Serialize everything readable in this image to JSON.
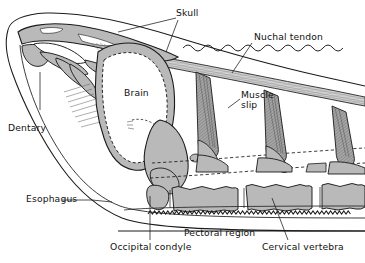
{
  "figure": {
    "kind": "anatomical-cutaway-diagram",
    "background_color": "#ffffff",
    "bone_fill_color": "#b9b9b9",
    "outline_color": "#1a1a1a",
    "tendon_fill_color": "#cfcfcf",
    "brain_fill_color": "#ffffff"
  },
  "labels": {
    "skull": "Skull",
    "nuchal_tendon": "Nuchal tendon",
    "brain": "Brain",
    "muscle_slip": "Muscle\nslip",
    "muscle_slip_line1": "Muscle",
    "muscle_slip_line2": "slip",
    "dentary": "Dentary",
    "esophagus": "Esophagus",
    "occipital_condyle": "Occipital condyle",
    "pectoral_region": "Pectoral region",
    "cervical_vertebra": "Cervical vertebra"
  },
  "structures": [
    {
      "name": "skull",
      "type": "bone",
      "fill": "#b9b9b9"
    },
    {
      "name": "brain",
      "type": "cavity",
      "fill": "#ffffff",
      "outline": "dashed"
    },
    {
      "name": "dentary",
      "type": "bone",
      "fill": "#b9b9b9"
    },
    {
      "name": "occipital-condyle",
      "type": "bone",
      "fill": "#b9b9b9"
    },
    {
      "name": "nuchal-tendon",
      "type": "tendon",
      "fill": "#cfcfcf",
      "striated": true
    },
    {
      "name": "muscle-slip",
      "type": "muscle",
      "fill": "#9a9a9a",
      "striated": true,
      "count": 3
    },
    {
      "name": "cervical-vertebra",
      "type": "bone",
      "fill": "#b9b9b9",
      "count": 4
    },
    {
      "name": "esophagus",
      "type": "soft-tissue",
      "outline": "zigzag"
    },
    {
      "name": "pectoral-region",
      "type": "region",
      "outline": "straight-line"
    },
    {
      "name": "skin-outline",
      "type": "outline",
      "outline": "wavy"
    }
  ]
}
